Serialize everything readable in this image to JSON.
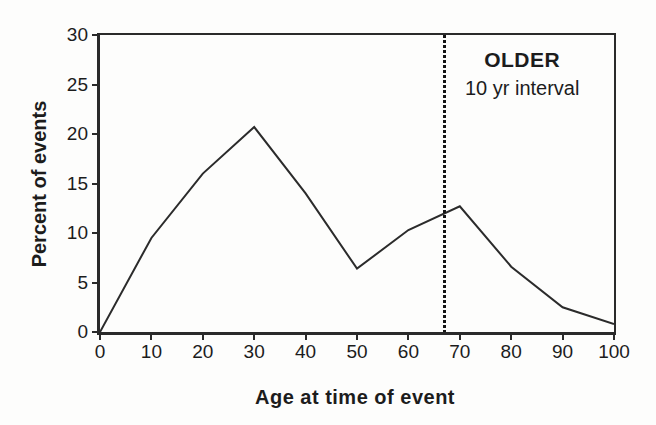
{
  "chart_data": {
    "type": "line",
    "x": [
      0,
      10,
      20,
      30,
      40,
      50,
      60,
      70,
      80,
      90,
      100
    ],
    "values": [
      0,
      9.5,
      16,
      20.7,
      14,
      6.4,
      10.3,
      12.7,
      6.6,
      2.5,
      0.8
    ],
    "title": "",
    "xlabel": "Age at time of event",
    "ylabel": "Percent of events",
    "xlim": [
      0,
      100
    ],
    "ylim": [
      0,
      30
    ],
    "x_ticks": [
      "0",
      "10",
      "20",
      "30",
      "40",
      "50",
      "60",
      "70",
      "80",
      "90",
      "100"
    ],
    "x_tick_values": [
      0,
      10,
      20,
      30,
      40,
      50,
      60,
      70,
      80,
      90,
      100
    ],
    "y_ticks": [
      "0",
      "5",
      "10",
      "15",
      "20",
      "25",
      "30"
    ],
    "y_tick_values": [
      0,
      5,
      10,
      15,
      20,
      25,
      30
    ],
    "grid": false,
    "legend_position": "none",
    "line_color": "#2b2b2b",
    "axis_color": "#2a2a2a",
    "background_color": "#fdfdfc",
    "reference_line": {
      "x": 67,
      "style": "dotted",
      "color": "#141414"
    },
    "annotation": {
      "line1": "OLDER",
      "line2": "10 yr interval"
    }
  }
}
